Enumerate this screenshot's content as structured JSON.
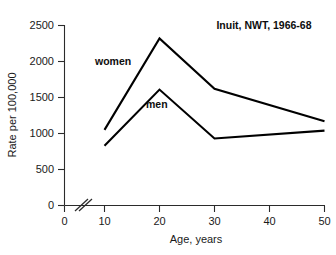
{
  "chart_data": {
    "type": "line",
    "title": "",
    "subtitle": "",
    "annotation": "Inuit, NWT, 1966-68",
    "xlabel": "Age, years",
    "ylabel": "Rate per 100,000",
    "x": [
      10,
      20,
      30,
      50
    ],
    "xlim": [
      10,
      50
    ],
    "ylim": [
      0,
      2500
    ],
    "xticks": [
      0,
      10,
      20,
      30,
      40,
      50
    ],
    "xtick_labels": [
      "0",
      "10",
      "20",
      "30",
      "40",
      "50"
    ],
    "yticks": [
      0,
      500,
      1000,
      1500,
      2000,
      2500
    ],
    "ytick_labels": [
      "0",
      "500",
      "1000",
      "1500",
      "2000",
      "2500"
    ],
    "grid": false,
    "legend_position": "inline-labels",
    "axis_break": {
      "axis": "x",
      "between": [
        0,
        10
      ],
      "symbol": "double-slash"
    },
    "series": [
      {
        "name": "women",
        "label": "women",
        "color": "#000000",
        "values": [
          1050,
          2320,
          1620,
          1170
        ]
      },
      {
        "name": "men",
        "label": "men",
        "color": "#000000",
        "values": [
          830,
          1610,
          930,
          1040
        ]
      }
    ]
  },
  "labels": {
    "women": "women",
    "men": "men"
  },
  "axes": {
    "x_title": "Age, years",
    "y_title": "Rate per 100,000"
  },
  "annotation": {
    "text": "Inuit, NWT, 1966-68"
  },
  "ticks": {
    "y": [
      "2500",
      "2000",
      "1500",
      "1000",
      "500",
      "0"
    ],
    "x": [
      "0",
      "10",
      "20",
      "30",
      "40",
      "50"
    ]
  }
}
